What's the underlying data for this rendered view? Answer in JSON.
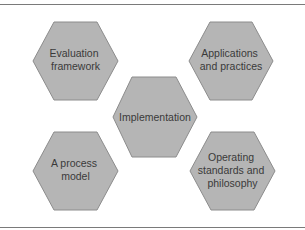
{
  "diagram": {
    "type": "hexagon-cluster",
    "colors": {
      "hex_fill": "#b5b5b5",
      "hex_stroke": "#8c8c8c",
      "text": "#3a3a3a",
      "rule": "#7a7a7a"
    },
    "nodes": [
      {
        "id": "evaluation-framework",
        "position": "top-left",
        "lines": [
          "Evaluation",
          "framework"
        ]
      },
      {
        "id": "applications-and-practices",
        "position": "top-right",
        "lines": [
          "Applications",
          "and practices"
        ]
      },
      {
        "id": "implementation",
        "position": "center",
        "lines": [
          "Implementation"
        ]
      },
      {
        "id": "a-process-model",
        "position": "bottom-left",
        "lines": [
          "A process",
          "model"
        ]
      },
      {
        "id": "operating-standards",
        "position": "bottom-right",
        "lines": [
          "Operating",
          "standards and",
          "philosophy"
        ]
      }
    ]
  }
}
